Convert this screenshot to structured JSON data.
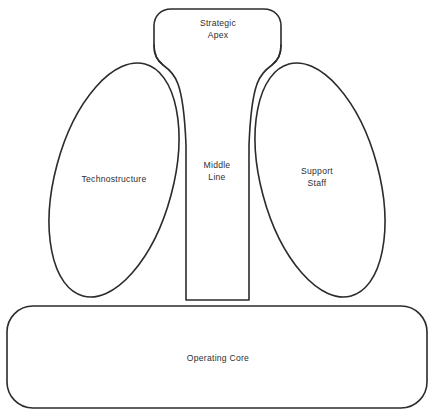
{
  "figure": {
    "kind": "organization-structure-diagram",
    "background_color": "#ffffff",
    "stroke_color": "#2b2b2b",
    "fill_color": "#ffffff"
  },
  "parts": {
    "strategic_apex": {
      "label": "Strategic\nApex",
      "shape": "rounded-trapezoid-flared-base",
      "position": "top-center"
    },
    "middle_line": {
      "label": "Middle\nLine",
      "shape": "narrow-vertical-channel",
      "position": "center"
    },
    "technostructure": {
      "label": "Technostructure",
      "shape": "tilted-ellipse",
      "position": "left"
    },
    "support_staff": {
      "label": "Support\nStaff",
      "shape": "tilted-ellipse",
      "position": "right"
    },
    "operating_core": {
      "label": "Operating Core",
      "shape": "wide-rounded-rectangle",
      "position": "bottom"
    }
  }
}
